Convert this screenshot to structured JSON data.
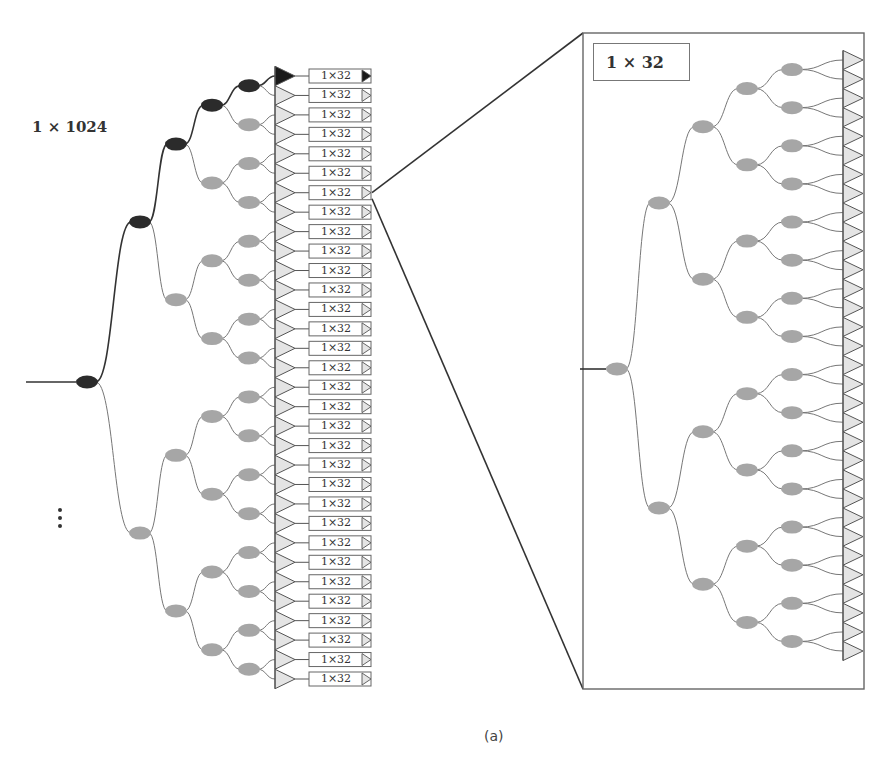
{
  "figure": {
    "main_label": "1 × 1024",
    "caption": "(a)",
    "module_label": "1×32",
    "module_count": 32,
    "zoom_key_label": "1 × 32",
    "colors": {
      "active_node": "#2b2b2b",
      "inactive_node": "#a6a6a6",
      "output_fill": "#e4e4e4",
      "output_stroke": "#555555",
      "active_output": "#1a1a1a",
      "line_dark": "#333333",
      "line_light": "#777777"
    }
  },
  "modules": [
    {
      "label": "1×32",
      "active": true
    },
    {
      "label": "1×32"
    },
    {
      "label": "1×32"
    },
    {
      "label": "1×32"
    },
    {
      "label": "1×32"
    },
    {
      "label": "1×32"
    },
    {
      "label": "1×32"
    },
    {
      "label": "1×32"
    },
    {
      "label": "1×32"
    },
    {
      "label": "1×32"
    },
    {
      "label": "1×32"
    },
    {
      "label": "1×32"
    },
    {
      "label": "1×32"
    },
    {
      "label": "1×32"
    },
    {
      "label": "1×32"
    },
    {
      "label": "1×32"
    },
    {
      "label": "1×32"
    },
    {
      "label": "1×32"
    },
    {
      "label": "1×32"
    },
    {
      "label": "1×32"
    },
    {
      "label": "1×32"
    },
    {
      "label": "1×32"
    },
    {
      "label": "1×32"
    },
    {
      "label": "1×32"
    },
    {
      "label": "1×32"
    },
    {
      "label": "1×32"
    },
    {
      "label": "1×32"
    },
    {
      "label": "1×32"
    },
    {
      "label": "1×32"
    },
    {
      "label": "1×32"
    },
    {
      "label": "1×32"
    },
    {
      "label": "1×32"
    }
  ]
}
